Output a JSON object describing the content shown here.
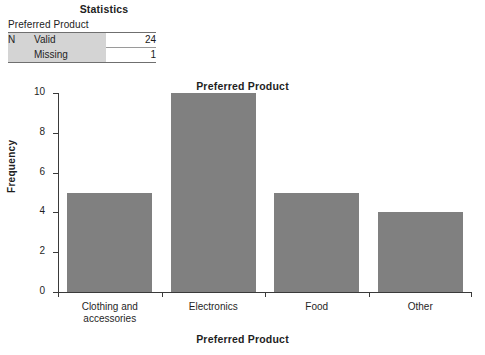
{
  "stats_table": {
    "title": "Statistics",
    "subtitle": "Preferred Product",
    "rows": [
      {
        "group": "N",
        "label": "Valid",
        "value": "24"
      },
      {
        "group": "",
        "label": "Missing",
        "value": "1"
      }
    ]
  },
  "chart_data": {
    "type": "bar",
    "title": "Preferred Product",
    "xlabel": "Preferred Product",
    "ylabel": "Frequency",
    "categories": [
      "Clothing and accessories",
      "Electronics",
      "Food",
      "Other"
    ],
    "category_lines": [
      [
        "Clothing and",
        "accessories"
      ],
      [
        "Electronics"
      ],
      [
        "Food"
      ],
      [
        "Other"
      ]
    ],
    "values": [
      5,
      10,
      5,
      4
    ],
    "ylim": [
      0,
      10
    ],
    "yticks": [
      0,
      2,
      4,
      6,
      8,
      10
    ],
    "ytick_labels": [
      "0",
      "2",
      "4",
      "6",
      "8",
      "10"
    ],
    "grid": false,
    "legend": false,
    "bar_color": "#808080",
    "axis_color": "#3a3a3a"
  }
}
